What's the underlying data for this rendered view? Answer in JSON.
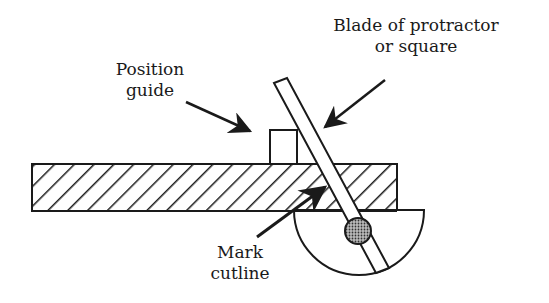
{
  "diagram": {
    "title": "",
    "labels": {
      "position_guide": [
        "Position",
        "guide"
      ],
      "blade": [
        "Blade of protractor",
        "or square"
      ],
      "mark_cutline": [
        "Mark",
        "cutline"
      ]
    },
    "components": [
      {
        "name": "workpiece-board",
        "style": "diagonal hatch"
      },
      {
        "name": "position-guide-block"
      },
      {
        "name": "protractor-blade"
      },
      {
        "name": "protractor-head",
        "shape": "semicircle"
      },
      {
        "name": "pivot",
        "style": "stippled circle"
      }
    ],
    "colors": {
      "line": "#1a1a1a",
      "background": "#ffffff",
      "pivot_fill": "#888888"
    }
  }
}
